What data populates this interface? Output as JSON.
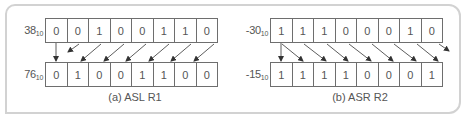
{
  "figure": {
    "panels": [
      {
        "id": "a",
        "caption": "(a) ASL R1",
        "operation": "ASL",
        "register": "R1",
        "top_row": {
          "value": "38",
          "base": "10",
          "bits": [
            "0",
            "0",
            "1",
            "0",
            "0",
            "1",
            "1",
            "0"
          ]
        },
        "bottom_row": {
          "value": "76",
          "base": "10",
          "bits": [
            "0",
            "1",
            "0",
            "0",
            "1",
            "1",
            "0",
            "0"
          ]
        },
        "arrow_direction": "left"
      },
      {
        "id": "b",
        "caption": "(b) ASR R2",
        "operation": "ASR",
        "register": "R2",
        "top_row": {
          "value": "-30",
          "base": "10",
          "bits": [
            "1",
            "1",
            "1",
            "0",
            "0",
            "0",
            "1",
            "0"
          ]
        },
        "bottom_row": {
          "value": "-15",
          "base": "10",
          "bits": [
            "1",
            "1",
            "1",
            "1",
            "0",
            "0",
            "0",
            "1"
          ]
        },
        "arrow_direction": "right"
      }
    ]
  },
  "colors": {
    "frame_border": "#d2d2d2",
    "cell_border": "#6e6e6e",
    "text": "#555555",
    "arrow": "#333333"
  }
}
